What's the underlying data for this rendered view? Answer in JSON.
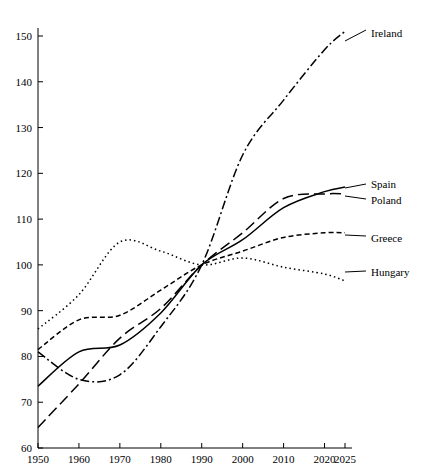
{
  "chart_data": {
    "type": "line",
    "title": "",
    "xlabel": "",
    "ylabel": "",
    "x": [
      1950,
      1960,
      1970,
      1980,
      1990,
      2000,
      2010,
      2020,
      2025
    ],
    "xlim": [
      1950,
      2025
    ],
    "ylim": [
      60,
      152
    ],
    "xticks": [
      "1950",
      "1960",
      "1970",
      "1980",
      "1990",
      "2000",
      "2010",
      "2020",
      "2025"
    ],
    "yticks": [
      "60",
      "70",
      "80",
      "90",
      "100",
      "110",
      "120",
      "130",
      "140",
      "150"
    ],
    "grid": false,
    "legend_position": "right-inline",
    "series": [
      {
        "name": "Ireland",
        "style": "dash-dot",
        "dasharray": "9,3,2,3",
        "values": [
          81.0,
          75.0,
          76.0,
          86.5,
          100.0,
          124.0,
          136.0,
          147.0,
          151.0
        ]
      },
      {
        "name": "Spain",
        "style": "solid",
        "dasharray": "none",
        "values": [
          73.5,
          81.0,
          82.5,
          89.5,
          100.0,
          105.5,
          112.5,
          116.0,
          117.0
        ]
      },
      {
        "name": "Poland",
        "style": "long-dash",
        "dasharray": "11,5",
        "values": [
          64.5,
          74.0,
          84.0,
          90.5,
          100.0,
          107.0,
          114.5,
          115.5,
          115.5
        ]
      },
      {
        "name": "Greece",
        "style": "short-dash",
        "dasharray": "5,3",
        "values": [
          81.5,
          88.0,
          89.0,
          94.5,
          100.0,
          103.0,
          106.0,
          107.0,
          107.0
        ]
      },
      {
        "name": "Hungary",
        "style": "dotted",
        "dasharray": "1.5,3",
        "values": [
          86.0,
          93.5,
          105.0,
          103.0,
          100.0,
          101.5,
          99.5,
          98.0,
          96.5
        ]
      }
    ]
  },
  "labels": {
    "ireland": "Ireland",
    "spain": "Spain",
    "poland": "Poland",
    "greece": "Greece",
    "hungary": "Hungary"
  },
  "faint_header": ""
}
